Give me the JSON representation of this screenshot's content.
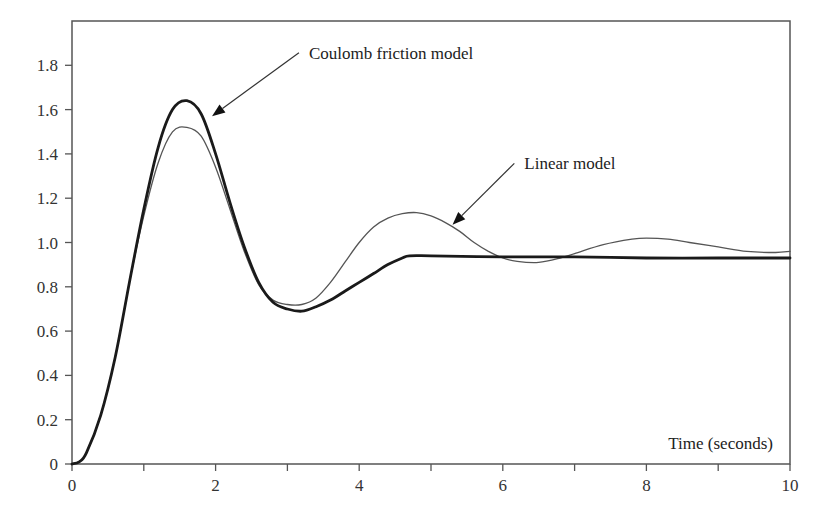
{
  "chart_data": {
    "type": "line",
    "title": "",
    "xlabel": "Time (seconds)",
    "ylabel": "",
    "xlim": [
      0,
      10
    ],
    "ylim": [
      0,
      2.0
    ],
    "x_ticks": [
      0,
      2,
      4,
      6,
      8,
      10
    ],
    "x_minor_ticks": [
      1,
      3,
      5,
      7,
      9
    ],
    "y_ticks": [
      0,
      0.2,
      0.4,
      0.6,
      0.8,
      1.0,
      1.2,
      1.4,
      1.6,
      1.8
    ],
    "x_tick_labels": [
      "0",
      "2",
      "4",
      "6",
      "8",
      "10"
    ],
    "y_tick_labels": [
      "0",
      "0.2",
      "0.4",
      "0.6",
      "0.8",
      "1.0",
      "1.2",
      "1.4",
      "1.6",
      "1.8"
    ],
    "grid": false,
    "legend": "none (annotated with arrows)",
    "series": [
      {
        "name": "Coulomb friction model",
        "style": "thick",
        "x": [
          0,
          0.1,
          0.2,
          0.4,
          0.6,
          0.8,
          1.0,
          1.2,
          1.4,
          1.6,
          1.8,
          2.0,
          2.2,
          2.4,
          2.6,
          2.8,
          3.0,
          3.2,
          3.4,
          3.6,
          3.8,
          4.0,
          4.2,
          4.4,
          4.6,
          4.7,
          5.0,
          6.0,
          7.0,
          8.0,
          9.0,
          10.0
        ],
        "y": [
          0,
          0.01,
          0.05,
          0.22,
          0.48,
          0.82,
          1.15,
          1.43,
          1.6,
          1.64,
          1.58,
          1.4,
          1.18,
          0.98,
          0.82,
          0.73,
          0.7,
          0.69,
          0.71,
          0.74,
          0.78,
          0.82,
          0.86,
          0.9,
          0.93,
          0.94,
          0.94,
          0.935,
          0.935,
          0.93,
          0.93,
          0.93
        ]
      },
      {
        "name": "Linear model",
        "style": "thin",
        "x": [
          0,
          0.1,
          0.2,
          0.4,
          0.6,
          0.8,
          1.0,
          1.2,
          1.4,
          1.6,
          1.8,
          2.0,
          2.2,
          2.4,
          2.6,
          2.8,
          3.0,
          3.2,
          3.4,
          3.6,
          3.8,
          4.0,
          4.2,
          4.4,
          4.6,
          4.8,
          5.0,
          5.2,
          5.4,
          5.6,
          5.8,
          6.0,
          6.2,
          6.5,
          6.8,
          7.0,
          7.4,
          7.8,
          8.0,
          8.3,
          8.6,
          9.0,
          9.4,
          9.8,
          10.0
        ],
        "y": [
          0,
          0.01,
          0.05,
          0.22,
          0.48,
          0.82,
          1.12,
          1.36,
          1.5,
          1.52,
          1.48,
          1.34,
          1.15,
          0.96,
          0.81,
          0.74,
          0.72,
          0.72,
          0.75,
          0.82,
          0.91,
          1.0,
          1.07,
          1.11,
          1.13,
          1.135,
          1.12,
          1.09,
          1.05,
          1.0,
          0.96,
          0.93,
          0.915,
          0.91,
          0.93,
          0.95,
          0.99,
          1.015,
          1.02,
          1.015,
          1.0,
          0.98,
          0.96,
          0.955,
          0.96
        ]
      }
    ],
    "annotations": [
      {
        "text": "Coulomb friction model",
        "text_x": 3.3,
        "text_y": 1.83,
        "arrow_to_x": 1.95,
        "arrow_to_y": 1.57
      },
      {
        "text": "Linear model",
        "text_x": 6.3,
        "text_y": 1.33,
        "arrow_to_x": 5.3,
        "arrow_to_y": 1.08
      }
    ]
  }
}
